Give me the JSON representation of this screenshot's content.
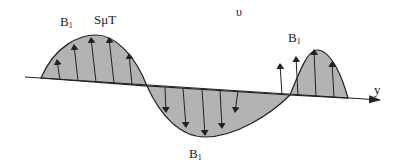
{
  "diagram": {
    "labels": {
      "b1_left": "B",
      "b1_left_sub": "1",
      "amplitude": "SμT",
      "symbol_top": "υ",
      "b1_right": "B",
      "b1_right_sub": "1",
      "b1_bottom": "B",
      "b1_bottom_sub": "1",
      "axis": "y"
    },
    "colors": {
      "fill": "#b3b3b3",
      "stroke": "#222222",
      "background": "#ffffff"
    }
  }
}
